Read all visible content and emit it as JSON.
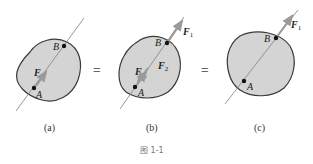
{
  "figure": {
    "caption": "图 1-1",
    "equals_sign": "=",
    "panels": [
      {
        "id": "a",
        "label": "(a)",
        "points": [
          "A",
          "B"
        ],
        "forces": [
          {
            "name": "F",
            "subscript": "",
            "at": "A",
            "direction": "along AB"
          }
        ]
      },
      {
        "id": "b",
        "label": "(b)",
        "points": [
          "A",
          "B"
        ],
        "forces": [
          {
            "name": "F",
            "subscript": "",
            "at": "A",
            "direction": "along AB"
          },
          {
            "name": "F",
            "subscript": "2",
            "at": "A",
            "direction": "along AB"
          },
          {
            "name": "F",
            "subscript": "1",
            "at": "B",
            "direction": "along AB"
          }
        ]
      },
      {
        "id": "c",
        "label": "(c)",
        "points": [
          "A",
          "B"
        ],
        "forces": [
          {
            "name": "F",
            "subscript": "1",
            "at": "B",
            "direction": "along AB"
          }
        ]
      }
    ]
  },
  "labels": {
    "a": {
      "caption": "(a)",
      "A": "A",
      "B": "B",
      "F": "F"
    },
    "b": {
      "caption": "(b)",
      "A": "A",
      "B": "B",
      "F": "F",
      "F2": "F",
      "F2_sub": "2",
      "F1": "F",
      "F1_sub": "1"
    },
    "c": {
      "caption": "(c)",
      "A": "A",
      "B": "B",
      "F1": "F",
      "F1_sub": "1"
    },
    "eq1": "=",
    "eq2": "=",
    "fig": "图 1-1"
  },
  "colors": {
    "body_fill": "#d4d4d4",
    "body_stroke": "#3a3a3a",
    "line": "#8a8a8a",
    "arrow": "#9a9a9a",
    "point": "#111111"
  }
}
